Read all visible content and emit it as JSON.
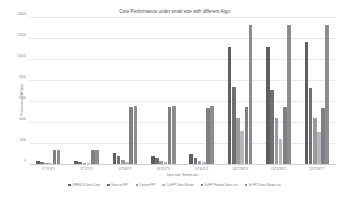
{
  "chart_data": {
    "type": "bar",
    "title": "Core Performance under small size with different Algo",
    "xlabel": "Input size / Kernel size",
    "ylabel": "Performance (MFlops)",
    "ylim": [
      0,
      14000
    ],
    "yticks": [
      0,
      2000,
      4000,
      6000,
      8000,
      10000,
      12000,
      14000
    ],
    "ytick_labels": [
      "0",
      "2000",
      "4000",
      "6000",
      "8000",
      "10000",
      "12000",
      "14000"
    ],
    "grid": true,
    "legend_position": "bottom",
    "categories": [
      "17*17/3*3",
      "17*17/5*5",
      "33*33/3*3",
      "65*65/3*3",
      "65*65/5*5",
      "129*129/3*3",
      "129*129/5*5",
      "129*129/7*7"
    ],
    "series": [
      {
        "name": "OPENCV Direct Conv",
        "color": "#5e5e62",
        "values": [
          420,
          360,
          1180,
          900,
          1060,
          11250,
          11200,
          11700
        ]
      },
      {
        "name": "Direct w/ FFT",
        "color": "#6f6f74",
        "values": [
          330,
          300,
          900,
          700,
          640,
          7400,
          7150,
          7380
        ]
      },
      {
        "name": "Custom FFT",
        "color": "#9a9aa0",
        "values": [
          210,
          190,
          480,
          430,
          370,
          4450,
          4480,
          4450
        ]
      },
      {
        "name": "Cv-FFT Direct Reuse",
        "color": "#b6b6bb",
        "values": [
          170,
          150,
          330,
          300,
          250,
          3250,
          2500,
          3100
        ]
      },
      {
        "name": "Ifa FFT Fastest Direct cuv",
        "color": "#7f7f85",
        "values": [
          1420,
          1420,
          5560,
          5560,
          5420,
          5480,
          5560,
          5420
        ]
      },
      {
        "name": "Ifa FFT Direct Reuse cuv",
        "color": "#8c8c92",
        "values": [
          1430,
          1440,
          5580,
          5580,
          5580,
          13380,
          13350,
          13380
        ]
      }
    ]
  }
}
